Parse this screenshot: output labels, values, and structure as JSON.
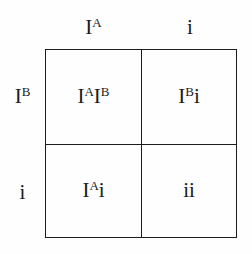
{
  "figure": {
    "type": "punnett-square",
    "rows": 2,
    "columns": 2,
    "line_color": "#1c1c1c",
    "background_color": "#fefefe",
    "text_color": "#1a1a1a"
  },
  "column_headers": [
    {
      "base": "I",
      "superscript": "A",
      "plain": "IA"
    },
    {
      "base": "i",
      "superscript": "",
      "plain": "i"
    }
  ],
  "row_headers": [
    {
      "base": "I",
      "superscript": "B",
      "plain": "IB"
    },
    {
      "base": "i",
      "superscript": "",
      "plain": "i"
    }
  ],
  "cells": [
    [
      {
        "allele1": {
          "base": "I",
          "superscript": "A"
        },
        "allele2": {
          "base": "I",
          "superscript": "B"
        },
        "plain": "IAIB"
      },
      {
        "allele1": {
          "base": "I",
          "superscript": "B"
        },
        "allele2": {
          "base": "i",
          "superscript": ""
        },
        "plain": "IBi"
      }
    ],
    [
      {
        "allele1": {
          "base": "I",
          "superscript": "A"
        },
        "allele2": {
          "base": "i",
          "superscript": ""
        },
        "plain": "IAi"
      },
      {
        "allele1": {
          "base": "i",
          "superscript": ""
        },
        "allele2": {
          "base": "i",
          "superscript": ""
        },
        "plain": "ii"
      }
    ]
  ]
}
